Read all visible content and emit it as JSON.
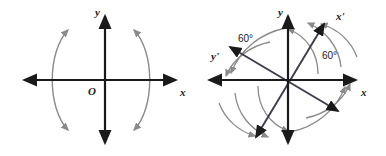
{
  "figure": {
    "kind": "math-diagram",
    "colors": {
      "axis": "#1a1a1a",
      "arc": "#8a8a8a",
      "background": "#ffffff",
      "text": "#1a1a1a"
    }
  },
  "panels": [
    {
      "id": "left",
      "name": "standard-axes-panel",
      "origin": {
        "x": 105,
        "y": 80,
        "label": "O"
      },
      "axes": [
        {
          "name": "x-axis",
          "label": "x",
          "label_x": 180,
          "label_y": 96,
          "x1": 22,
          "y1": 80,
          "x2": 178,
          "y2": 80,
          "arrow_start": true,
          "arrow_end": true
        },
        {
          "name": "y-axis",
          "label": "y",
          "label_x": 97,
          "label_y": 16,
          "x1": 105,
          "y1": 145,
          "x2": 105,
          "y2": 14,
          "arrow_start": true,
          "arrow_end": true
        }
      ],
      "arcs": [
        {
          "name": "left-arc",
          "path": "M 68 30 C 47 52 47 108 68 130",
          "arrow_start": true,
          "arrow_end": true
        },
        {
          "name": "right-arc",
          "path": "M 155 30 C 134 52 134 108 155 130",
          "arrow_start": true,
          "arrow_end": true,
          "mirrored": true
        }
      ]
    },
    {
      "id": "right",
      "name": "rotated-axes-panel",
      "origin": {
        "x": 288,
        "y": 80,
        "label": ""
      },
      "rotation_degrees": 60,
      "axes": [
        {
          "name": "x-axis",
          "label": "x",
          "label_x": 362,
          "label_y": 96,
          "x1": 207,
          "y1": 80,
          "x2": 358,
          "y2": 80,
          "arrow_start": true,
          "arrow_end": true
        },
        {
          "name": "y-axis",
          "label": "y",
          "label_x": 280,
          "label_y": 16,
          "x1": 288,
          "y1": 145,
          "x2": 288,
          "y2": 14,
          "arrow_start": true,
          "arrow_end": true
        },
        {
          "name": "x-prime-axis",
          "label": "x'",
          "label_x": 337,
          "label_y": 20,
          "x1": 254,
          "y1": 139,
          "x2": 326,
          "y2": 20,
          "arrow_start": true,
          "arrow_end": true
        },
        {
          "name": "y-prime-axis",
          "label": "y'",
          "label_x": 213,
          "label_y": 58,
          "x1": 340,
          "y1": 112,
          "x2": 228,
          "y2": 45,
          "arrow_start": true,
          "arrow_end": true
        }
      ],
      "angle_labels": [
        {
          "name": "angle-label-left",
          "text": "60°",
          "x": 243,
          "y": 40
        },
        {
          "name": "angle-label-right",
          "text": "60°",
          "x": 327,
          "y": 56
        }
      ],
      "arcs": [
        {
          "name": "rotation-arc-1",
          "path": "M 318 74 C 318 52 306 36 288 30",
          "arrow_end": true
        },
        {
          "name": "rotation-arc-2",
          "path": "M 341 66 C 338 46 325 30 307 22",
          "arrow_end": true
        },
        {
          "name": "rotation-arc-3",
          "path": "M 356 52 C 348 38 334 28 318 23",
          "arrow_end": true
        },
        {
          "name": "rotation-arc-4",
          "path": "M 258 86 C 258 108 270 124 288 130",
          "arrow_end": true
        },
        {
          "name": "rotation-arc-5",
          "path": "M 235 94 C 238 114 251 130 269 138",
          "arrow_end": true
        },
        {
          "name": "rotation-arc-6",
          "path": "M 220 108 C 228 122 242 132 258 137",
          "arrow_end": true
        },
        {
          "name": "rotation-arc-7",
          "path": "M 267 44 C 247 46 230 58 222 74",
          "arrow_end": true
        },
        {
          "name": "rotation-arc-8",
          "path": "M 283 30 C 258 34 238 50 228 72",
          "arrow_end": true
        },
        {
          "name": "rotation-arc-9",
          "path": "M 309 116 C 329 114 346 102 354 86",
          "arrow_end": true
        },
        {
          "name": "rotation-arc-10",
          "path": "M 293 130 C 318 126 338 110 348 88",
          "arrow_end": true
        }
      ]
    }
  ]
}
